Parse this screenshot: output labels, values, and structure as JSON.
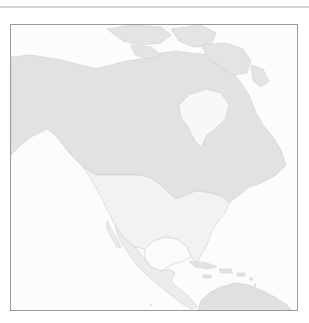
{
  "map": {
    "region": "North America",
    "projection_view": "orthographic-style regional view",
    "colors": {
      "ocean": "#fcfcfc",
      "frame_border": "#9a9a9a",
      "top_rule": "#d6d6d6",
      "canada_alaska": "#e2e2e2",
      "greenland_arctic": "#e4e4e4",
      "usa": "#f2f2f2",
      "mexico_central_america": "#ececec",
      "south_america": "#e0e0e0",
      "caribbean_islands": "#e2e2e2",
      "coastline": "#cfcfcf"
    },
    "features": [
      {
        "name": "Alaska",
        "shade": "canada_alaska"
      },
      {
        "name": "Canada",
        "shade": "canada_alaska"
      },
      {
        "name": "Canadian Arctic Archipelago",
        "shade": "greenland_arctic"
      },
      {
        "name": "Hudson Bay",
        "shade": "ocean"
      },
      {
        "name": "United States",
        "shade": "usa"
      },
      {
        "name": "Gulf of Mexico",
        "shade": "ocean"
      },
      {
        "name": "Mexico",
        "shade": "mexico_central_america"
      },
      {
        "name": "Central America",
        "shade": "mexico_central_america"
      },
      {
        "name": "Caribbean Islands",
        "shade": "caribbean_islands"
      },
      {
        "name": "South America (north)",
        "shade": "south_america"
      }
    ]
  }
}
